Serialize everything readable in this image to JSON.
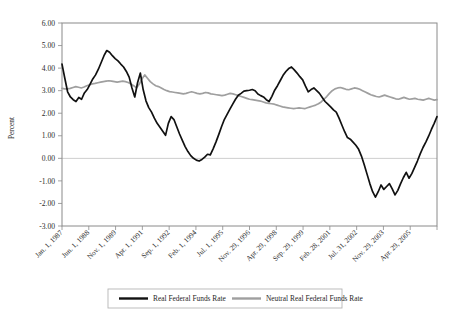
{
  "chart_data": {
    "type": "line",
    "title": "",
    "xlabel": "",
    "ylabel": "Percent",
    "ylim": [
      -3.0,
      6.0
    ],
    "ytick_labels": [
      "6.00",
      "5.00",
      "4.00",
      "3.00",
      "2.00",
      "1.00",
      "0.00",
      "-1.00",
      "-2.00",
      "-3.00"
    ],
    "ytick_values": [
      6.0,
      5.0,
      4.0,
      3.0,
      2.0,
      1.0,
      0.0,
      -1.0,
      -2.0,
      -3.0
    ],
    "grid": "zero-line-only",
    "legend_position": "bottom-center",
    "xtick_labels": [
      "Jan. 1, 1987",
      "Jun. 1, 1988",
      "Nov. 1, 1989",
      "Apr. 1, 1991",
      "Sep. 1, 1992",
      "Feb. 1, 1994",
      "Jul. 1, 1995",
      "Nov. 29, 1996",
      "Apr. 29, 1998",
      "Sep. 29, 1999",
      "Feb. 28, 2001",
      "Jul. 31, 2002",
      "Nov. 29, 2003",
      "Apr. 29, 2005"
    ],
    "series": [
      {
        "name": "Real Federal Funds Rate",
        "color": "#111111",
        "values": [
          4.18,
          3.55,
          2.95,
          2.72,
          2.6,
          2.52,
          2.7,
          2.62,
          2.9,
          3.05,
          3.28,
          3.52,
          3.7,
          3.95,
          4.25,
          4.55,
          4.78,
          4.7,
          4.55,
          4.42,
          4.32,
          4.18,
          4.05,
          3.85,
          3.6,
          3.12,
          2.72,
          3.35,
          3.78,
          3.05,
          2.55,
          2.25,
          2.05,
          1.78,
          1.55,
          1.38,
          1.2,
          1.02,
          1.55,
          1.85,
          1.72,
          1.4,
          1.08,
          0.8,
          0.52,
          0.3,
          0.12,
          0.0,
          -0.08,
          -0.12,
          -0.05,
          0.05,
          0.18,
          0.15,
          0.42,
          0.72,
          1.05,
          1.4,
          1.72,
          1.95,
          2.18,
          2.4,
          2.62,
          2.8,
          2.88,
          2.98,
          3.0,
          3.02,
          3.05,
          3.0,
          2.85,
          2.78,
          2.72,
          2.6,
          2.52,
          2.75,
          3.02,
          3.22,
          3.45,
          3.68,
          3.85,
          3.98,
          4.05,
          3.92,
          3.78,
          3.62,
          3.48,
          3.2,
          2.95,
          3.05,
          3.12,
          3.0,
          2.88,
          2.7,
          2.52,
          2.4,
          2.28,
          2.15,
          2.05,
          1.78,
          1.48,
          1.18,
          0.92,
          0.85,
          0.72,
          0.58,
          0.4,
          0.1,
          -0.28,
          -0.7,
          -1.12,
          -1.48,
          -1.72,
          -1.48,
          -1.18,
          -1.38,
          -1.25,
          -1.12,
          -1.35,
          -1.62,
          -1.42,
          -1.12,
          -0.85,
          -0.62,
          -0.88,
          -0.68,
          -0.4,
          -0.12,
          0.2,
          0.48,
          0.72,
          0.98,
          1.28,
          1.55,
          1.85
        ]
      },
      {
        "name": "Neutral Real Federal Funds Rate",
        "color": "#9f9f9f",
        "values": [
          3.1,
          3.08,
          3.08,
          3.1,
          3.14,
          3.18,
          3.15,
          3.12,
          3.16,
          3.22,
          3.26,
          3.3,
          3.32,
          3.35,
          3.38,
          3.4,
          3.42,
          3.44,
          3.42,
          3.4,
          3.38,
          3.4,
          3.42,
          3.4,
          3.36,
          3.3,
          3.22,
          3.12,
          3.28,
          3.52,
          3.7,
          3.55,
          3.4,
          3.3,
          3.22,
          3.18,
          3.12,
          3.05,
          3.0,
          2.96,
          2.94,
          2.92,
          2.9,
          2.88,
          2.86,
          2.88,
          2.92,
          2.95,
          2.92,
          2.88,
          2.86,
          2.88,
          2.92,
          2.9,
          2.86,
          2.84,
          2.82,
          2.8,
          2.78,
          2.8,
          2.84,
          2.88,
          2.86,
          2.82,
          2.78,
          2.74,
          2.7,
          2.66,
          2.62,
          2.6,
          2.58,
          2.56,
          2.54,
          2.5,
          2.46,
          2.44,
          2.42,
          2.4,
          2.36,
          2.32,
          2.28,
          2.26,
          2.24,
          2.22,
          2.2,
          2.22,
          2.24,
          2.22,
          2.2,
          2.24,
          2.28,
          2.32,
          2.36,
          2.42,
          2.5,
          2.62,
          2.74,
          2.88,
          3.0,
          3.08,
          3.12,
          3.14,
          3.1,
          3.06,
          3.04,
          3.08,
          3.12,
          3.1,
          3.06,
          3.0,
          2.94,
          2.88,
          2.82,
          2.78,
          2.74,
          2.72,
          2.76,
          2.8,
          2.76,
          2.72,
          2.68,
          2.64,
          2.62,
          2.66,
          2.7,
          2.66,
          2.62,
          2.64,
          2.66,
          2.62,
          2.6,
          2.58,
          2.62,
          2.66,
          2.62,
          2.58,
          2.6
        ]
      }
    ]
  },
  "legend": {
    "entries": [
      {
        "label": "Real Federal Funds Rate"
      },
      {
        "label": "Neutral Real Federal Funds Rate"
      }
    ]
  }
}
